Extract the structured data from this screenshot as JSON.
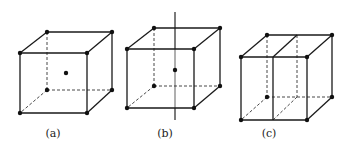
{
  "figures": [
    {
      "label": "(a)",
      "description": "cube with body-center point",
      "center_dot": true,
      "axis": false,
      "midplane": false
    },
    {
      "label": "(b)",
      "description": "cube with body-center point and vertical axis",
      "center_dot": true,
      "axis": true,
      "midplane": false
    },
    {
      "label": "(c)",
      "description": "cube split by vertical midplane",
      "center_dot": false,
      "axis": false,
      "midplane": true
    }
  ],
  "colors": {
    "line": "#1a1a1a",
    "background": "#ffffff"
  }
}
